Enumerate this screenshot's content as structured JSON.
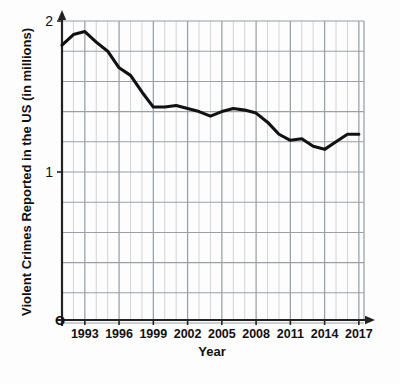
{
  "chart_data": {
    "type": "line",
    "title": "",
    "xlabel": "Year",
    "ylabel": "Violent Crimes Reported in the US (in millions)",
    "xlim": [
      1991,
      2017
    ],
    "ylim": [
      0,
      2
    ],
    "xtick_labels": [
      "1993",
      "1996",
      "1999",
      "2002",
      "2005",
      "2008",
      "2011",
      "2014",
      "2017"
    ],
    "xtick_values": [
      1993,
      1996,
      1999,
      2002,
      2005,
      2008,
      2011,
      2014,
      2017
    ],
    "ytick_labels": [
      "1",
      "2"
    ],
    "ytick_values": [
      1,
      2
    ],
    "origin_label": "O",
    "grid": true,
    "grid_minor_x_step": 1,
    "grid_major_x_step": 3,
    "grid_y_step": 0.2,
    "legend": "none",
    "line_color": "#111111",
    "grid_color": "#9aa0a6",
    "grid_minor_color": "#c9ccd1",
    "axis_color": "#222222",
    "background_color": "#fdfdfd",
    "x": [
      1991,
      1992,
      1993,
      1994,
      1995,
      1996,
      1997,
      1998,
      1999,
      2000,
      2001,
      2002,
      2003,
      2004,
      2005,
      2006,
      2007,
      2008,
      2009,
      2010,
      2011,
      2012,
      2013,
      2014,
      2015,
      2016,
      2017
    ],
    "series": [
      {
        "name": "Violent Crimes Reported in the US",
        "values": [
          1.84,
          1.91,
          1.93,
          1.86,
          1.8,
          1.69,
          1.64,
          1.53,
          1.43,
          1.43,
          1.44,
          1.42,
          1.4,
          1.37,
          1.4,
          1.42,
          1.41,
          1.39,
          1.33,
          1.25,
          1.21,
          1.22,
          1.17,
          1.15,
          1.2,
          1.25,
          1.25
        ]
      }
    ]
  },
  "axes": {
    "x_title": "Year",
    "y_title": "Violent Crimes Reported in the US (in millions)",
    "origin": "O"
  }
}
